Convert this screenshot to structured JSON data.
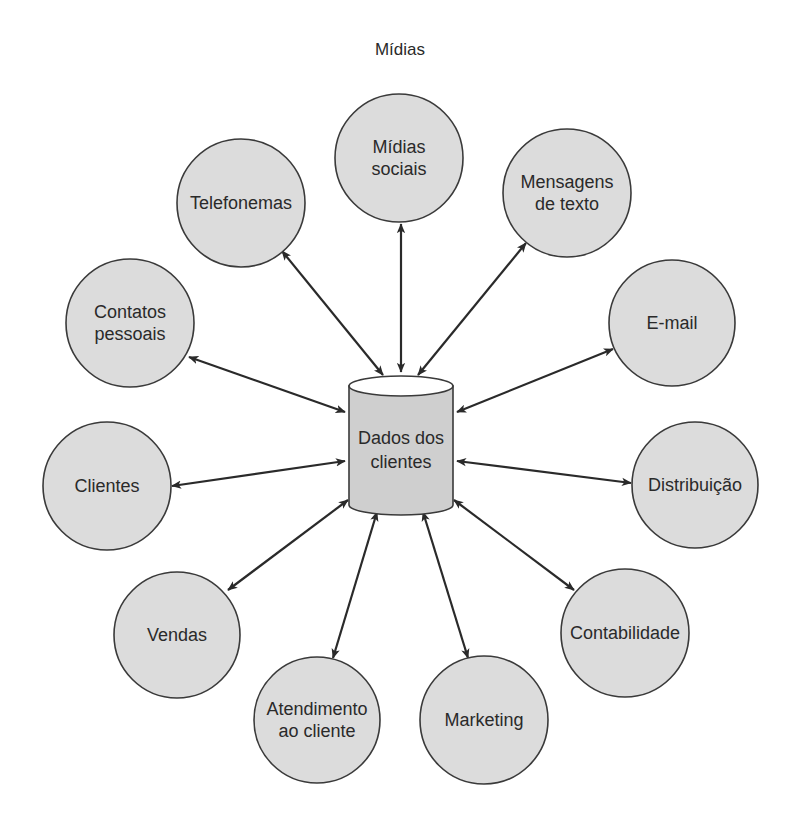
{
  "title": "Mídias",
  "center": {
    "label_lines": [
      "Dados dos",
      "clientes"
    ],
    "shape": "cylinder",
    "x": 401,
    "top": 386,
    "bottom": 505,
    "rx": 52,
    "ry": 10
  },
  "colors": {
    "node_fill": "#dcdcdc",
    "node_stroke": "#3a3a3a",
    "arrow": "#2a2a2a",
    "text": "#2a2a2a"
  },
  "nodes": [
    {
      "id": "midias-sociais",
      "lines": [
        "Mídias",
        "sociais"
      ],
      "cx": 399,
      "cy": 158,
      "r": 64
    },
    {
      "id": "telefonemas",
      "lines": [
        "Telefonemas"
      ],
      "cx": 241,
      "cy": 203,
      "r": 64
    },
    {
      "id": "mensagens-de-texto",
      "lines": [
        "Mensagens",
        "de texto"
      ],
      "cx": 567,
      "cy": 193,
      "r": 64
    },
    {
      "id": "contatos-pessoais",
      "lines": [
        "Contatos",
        "pessoais"
      ],
      "cx": 130,
      "cy": 323,
      "r": 64
    },
    {
      "id": "e-mail",
      "lines": [
        "E-mail"
      ],
      "cx": 672,
      "cy": 323,
      "r": 63
    },
    {
      "id": "clientes",
      "lines": [
        "Clientes"
      ],
      "cx": 107,
      "cy": 486,
      "r": 64
    },
    {
      "id": "distribuicao",
      "lines": [
        "Distribuição"
      ],
      "cx": 695,
      "cy": 485,
      "r": 63
    },
    {
      "id": "vendas",
      "lines": [
        "Vendas"
      ],
      "cx": 177,
      "cy": 635,
      "r": 63
    },
    {
      "id": "contabilidade",
      "lines": [
        "Contabilidade"
      ],
      "cx": 625,
      "cy": 633,
      "r": 64
    },
    {
      "id": "atendimento-ao-cliente",
      "lines": [
        "Atendimento",
        "ao cliente"
      ],
      "cx": 317,
      "cy": 720,
      "r": 63
    },
    {
      "id": "marketing",
      "lines": [
        "Marketing"
      ],
      "cx": 484,
      "cy": 720,
      "r": 64
    }
  ],
  "edges": [
    {
      "to": "midias-sociais",
      "x1": 401,
      "y1": 372,
      "x2": 401,
      "y2": 224,
      "bidirectional": true
    },
    {
      "to": "telefonemas",
      "x1": 383,
      "y1": 375,
      "x2": 282,
      "y2": 251,
      "bidirectional": true
    },
    {
      "to": "mensagens-de-texto",
      "x1": 418,
      "y1": 375,
      "x2": 526,
      "y2": 243,
      "bidirectional": true
    },
    {
      "to": "contatos-pessoais",
      "x1": 345,
      "y1": 412,
      "x2": 189,
      "y2": 357,
      "bidirectional": true
    },
    {
      "to": "e-mail",
      "x1": 457,
      "y1": 412,
      "x2": 613,
      "y2": 349,
      "bidirectional": true
    },
    {
      "to": "clientes",
      "x1": 345,
      "y1": 461,
      "x2": 172,
      "y2": 486,
      "bidirectional": true
    },
    {
      "to": "distribuicao",
      "x1": 457,
      "y1": 461,
      "x2": 631,
      "y2": 483,
      "bidirectional": true
    },
    {
      "to": "vendas",
      "x1": 348,
      "y1": 500,
      "x2": 228,
      "y2": 590,
      "bidirectional": true
    },
    {
      "to": "contabilidade",
      "x1": 454,
      "y1": 500,
      "x2": 574,
      "y2": 590,
      "bidirectional": true
    },
    {
      "to": "atendimento-ao-cliente",
      "x1": 377,
      "y1": 512,
      "x2": 333,
      "y2": 658,
      "bidirectional": true
    },
    {
      "to": "marketing",
      "x1": 423,
      "y1": 512,
      "x2": 468,
      "y2": 658,
      "bidirectional": true
    }
  ]
}
